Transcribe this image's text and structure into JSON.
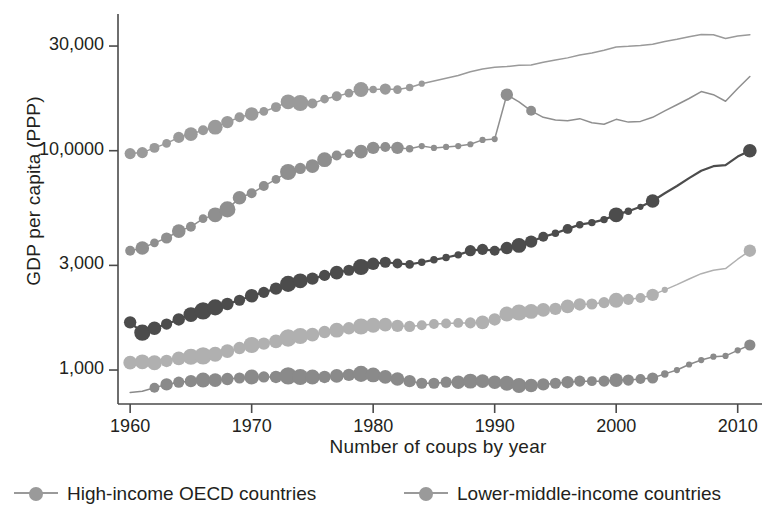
{
  "chart_data": {
    "type": "line",
    "title": "",
    "subtitle": "",
    "xlabel": "Number of coups by year",
    "ylabel": "GDP per capita (PPP)",
    "yscale": "log",
    "xlim": [
      1959,
      2012
    ],
    "ylim": [
      700,
      42000
    ],
    "grid": false,
    "legend_position": "bottom",
    "yticks": [
      1000,
      3000,
      10000,
      30000
    ],
    "ytick_labels": [
      "1,000",
      "3,000",
      "10,0000",
      "30,000"
    ],
    "xticks": [
      1960,
      1970,
      1980,
      1990,
      2000,
      2010
    ],
    "xtick_labels": [
      "1960",
      "1970",
      "1980",
      "1990",
      "2000",
      "2010"
    ],
    "note": "Marker size encodes number of coups in that year; larger bubbles mean more coups.",
    "series": [
      {
        "name": "High-income OECD countries",
        "color": "#9a9a9a",
        "legend": true,
        "x": [
          1960,
          1961,
          1962,
          1963,
          1964,
          1965,
          1966,
          1967,
          1968,
          1969,
          1970,
          1971,
          1972,
          1973,
          1974,
          1975,
          1976,
          1977,
          1978,
          1979,
          1980,
          1981,
          1982,
          1983,
          1984,
          1985,
          1986,
          1987,
          1988,
          1989,
          1990,
          1991,
          1992,
          1993,
          1994,
          1995,
          1996,
          1997,
          1998,
          1999,
          2000,
          2001,
          2002,
          2003,
          2004,
          2005,
          2006,
          2007,
          2008,
          2009,
          2010,
          2011
        ],
        "y": [
          9700,
          9800,
          10300,
          10800,
          11500,
          11900,
          12400,
          12800,
          13500,
          14200,
          14700,
          15100,
          15800,
          16700,
          16500,
          16400,
          17200,
          17700,
          18300,
          19000,
          19000,
          19100,
          19000,
          19400,
          20200,
          20800,
          21400,
          22000,
          22900,
          23600,
          24000,
          24200,
          24500,
          24600,
          25300,
          25900,
          26500,
          27300,
          27900,
          28700,
          29700,
          29900,
          30200,
          30600,
          31500,
          32200,
          33100,
          33900,
          33800,
          32500,
          33300,
          33800
        ],
        "marker_sizes": [
          9,
          9,
          8,
          7,
          9,
          11,
          8,
          12,
          10,
          8,
          11,
          7,
          8,
          12,
          13,
          8,
          7,
          8,
          7,
          12,
          6,
          9,
          7,
          6,
          5,
          4,
          4,
          4,
          4,
          4,
          4,
          4,
          4,
          4,
          4,
          4,
          4,
          4,
          4,
          4,
          4,
          4,
          4,
          4,
          4,
          4,
          4,
          4,
          4,
          4,
          4,
          4
        ]
      },
      {
        "name": "Upper-middle-income countries",
        "color": "#8f8f8f",
        "legend": false,
        "x": [
          1960,
          1961,
          1962,
          1963,
          1964,
          1965,
          1966,
          1967,
          1968,
          1969,
          1970,
          1971,
          1972,
          1973,
          1974,
          1975,
          1976,
          1977,
          1978,
          1979,
          1980,
          1981,
          1982,
          1983,
          1984,
          1985,
          1986,
          1987,
          1988,
          1989,
          1990,
          1991,
          1992,
          1993,
          1994,
          1995,
          1996,
          1997,
          1998,
          1999,
          2000,
          2001,
          2002,
          2003,
          2004,
          2005,
          2006,
          2007,
          2008,
          2009,
          2010,
          2011
        ],
        "y": [
          3500,
          3600,
          3800,
          4000,
          4300,
          4500,
          4900,
          5100,
          5400,
          6100,
          6400,
          6900,
          7400,
          8000,
          8300,
          8500,
          9100,
          9500,
          9700,
          9900,
          10300,
          10400,
          10300,
          10200,
          10500,
          10300,
          10400,
          10500,
          10700,
          11200,
          11300,
          18000,
          16700,
          15200,
          14200,
          13800,
          13700,
          14000,
          13400,
          13200,
          13900,
          13500,
          13600,
          14200,
          15200,
          16200,
          17300,
          18600,
          18000,
          16800,
          19200,
          21800
        ],
        "marker_sizes": [
          8,
          11,
          7,
          9,
          11,
          8,
          7,
          12,
          13,
          11,
          8,
          8,
          7,
          13,
          9,
          11,
          12,
          8,
          7,
          11,
          10,
          8,
          10,
          6,
          5,
          5,
          5,
          5,
          5,
          5,
          5,
          10,
          4,
          8,
          4,
          4,
          4,
          4,
          4,
          4,
          4,
          4,
          4,
          4,
          4,
          4,
          4,
          4,
          4,
          4,
          4,
          4
        ]
      },
      {
        "name": "Middle-income countries",
        "color": "#4c4c4c",
        "legend": false,
        "x": [
          1960,
          1961,
          1962,
          1963,
          1964,
          1965,
          1966,
          1967,
          1968,
          1969,
          1970,
          1971,
          1972,
          1973,
          1974,
          1975,
          1976,
          1977,
          1978,
          1979,
          1980,
          1981,
          1982,
          1983,
          1984,
          1985,
          1986,
          1987,
          1988,
          1989,
          1990,
          1991,
          1992,
          1993,
          1994,
          1995,
          1996,
          1997,
          1998,
          1999,
          2000,
          2001,
          2002,
          2003,
          2004,
          2005,
          2006,
          2007,
          2008,
          2009,
          2010,
          2011
        ],
        "y": [
          1650,
          1480,
          1550,
          1620,
          1700,
          1790,
          1860,
          1930,
          2000,
          2080,
          2180,
          2260,
          2350,
          2470,
          2550,
          2610,
          2700,
          2780,
          2850,
          2950,
          3050,
          3100,
          3060,
          3030,
          3100,
          3180,
          3260,
          3350,
          3500,
          3550,
          3500,
          3600,
          3700,
          3850,
          4050,
          4200,
          4400,
          4600,
          4700,
          4850,
          5100,
          5300,
          5550,
          5900,
          6400,
          6900,
          7500,
          8100,
          8500,
          8600,
          9400,
          10000
        ],
        "marker_sizes": [
          10,
          13,
          11,
          9,
          10,
          12,
          14,
          13,
          10,
          9,
          11,
          9,
          10,
          13,
          12,
          10,
          9,
          11,
          9,
          13,
          10,
          9,
          8,
          7,
          6,
          6,
          6,
          6,
          9,
          9,
          8,
          10,
          12,
          10,
          8,
          6,
          8,
          6,
          6,
          6,
          12,
          6,
          5,
          11,
          4,
          4,
          4,
          4,
          4,
          4,
          4,
          11
        ]
      },
      {
        "name": "Lower-middle-income countries",
        "color": "#b0b0b0",
        "legend": true,
        "x": [
          1960,
          1961,
          1962,
          1963,
          1964,
          1965,
          1966,
          1967,
          1968,
          1969,
          1970,
          1971,
          1972,
          1973,
          1974,
          1975,
          1976,
          1977,
          1978,
          1979,
          1980,
          1981,
          1982,
          1983,
          1984,
          1985,
          1986,
          1987,
          1988,
          1989,
          1990,
          1991,
          1992,
          1993,
          1994,
          1995,
          1996,
          1997,
          1998,
          1999,
          2000,
          2001,
          2002,
          2003,
          2004,
          2005,
          2006,
          2007,
          2008,
          2009,
          2010,
          2011
        ],
        "y": [
          1080,
          1090,
          1080,
          1100,
          1130,
          1150,
          1160,
          1180,
          1220,
          1260,
          1300,
          1320,
          1350,
          1400,
          1430,
          1450,
          1490,
          1520,
          1550,
          1580,
          1600,
          1610,
          1590,
          1580,
          1600,
          1620,
          1630,
          1640,
          1640,
          1650,
          1700,
          1800,
          1830,
          1850,
          1880,
          1900,
          1950,
          1990,
          2000,
          2030,
          2080,
          2100,
          2130,
          2200,
          2320,
          2450,
          2600,
          2750,
          2850,
          2900,
          3200,
          3500
        ],
        "marker_sizes": [
          11,
          12,
          12,
          10,
          11,
          13,
          14,
          12,
          11,
          10,
          13,
          10,
          11,
          14,
          13,
          11,
          10,
          12,
          10,
          13,
          12,
          11,
          10,
          9,
          8,
          8,
          8,
          8,
          9,
          11,
          10,
          12,
          13,
          12,
          11,
          10,
          11,
          10,
          9,
          9,
          12,
          9,
          8,
          10,
          5,
          4,
          4,
          4,
          4,
          4,
          4,
          10
        ]
      },
      {
        "name": "Low-income countries",
        "color": "#8a8a8a",
        "legend": false,
        "x": [
          1960,
          1961,
          1962,
          1963,
          1964,
          1965,
          1966,
          1967,
          1968,
          1969,
          1970,
          1971,
          1972,
          1973,
          1974,
          1975,
          1976,
          1977,
          1978,
          1979,
          1980,
          1981,
          1982,
          1983,
          1984,
          1985,
          1986,
          1987,
          1988,
          1989,
          1990,
          1991,
          1992,
          1993,
          1994,
          1995,
          1996,
          1997,
          1998,
          1999,
          2000,
          2001,
          2002,
          2003,
          2004,
          2005,
          2006,
          2007,
          2008,
          2009,
          2010,
          2011
        ],
        "y": [
          790,
          800,
          830,
          860,
          880,
          890,
          900,
          900,
          910,
          920,
          930,
          930,
          930,
          940,
          930,
          930,
          930,
          940,
          950,
          960,
          950,
          930,
          910,
          890,
          870,
          870,
          880,
          880,
          890,
          890,
          880,
          870,
          850,
          850,
          860,
          870,
          880,
          890,
          890,
          890,
          900,
          900,
          910,
          920,
          960,
          1000,
          1060,
          1110,
          1150,
          1160,
          1230,
          1300
        ],
        "marker_sizes": [
          4,
          4,
          8,
          10,
          9,
          10,
          12,
          11,
          10,
          9,
          12,
          9,
          10,
          14,
          13,
          12,
          10,
          11,
          10,
          13,
          12,
          11,
          11,
          10,
          9,
          9,
          9,
          11,
          12,
          11,
          11,
          12,
          12,
          11,
          10,
          9,
          10,
          9,
          8,
          9,
          11,
          9,
          8,
          9,
          6,
          5,
          5,
          5,
          5,
          5,
          5,
          9
        ]
      }
    ]
  },
  "legend": {
    "entries": [
      {
        "label": "High-income OECD countries",
        "color": "#9a9a9a"
      },
      {
        "label": "Lower-middle-income countries",
        "color": "#9a9a9a"
      }
    ]
  },
  "axes": {
    "x_title": "Number of coups by year",
    "y_title": "GDP per capita (PPP)",
    "ytick_labels": [
      "30,000",
      "10,0000",
      "3,000",
      "1,000"
    ],
    "xtick_labels": [
      "1960",
      "1970",
      "1980",
      "1990",
      "2000",
      "2010"
    ]
  },
  "colors": {
    "axis": "#4a4a4a",
    "text": "#231f20",
    "background": "#ffffff"
  }
}
